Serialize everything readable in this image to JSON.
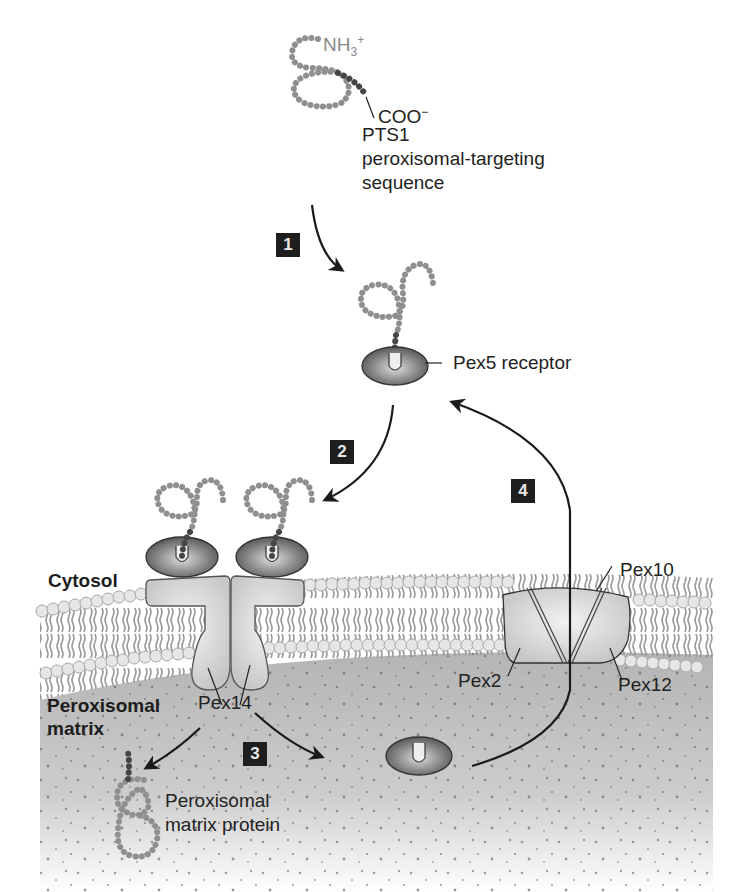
{
  "figure": {
    "colors": {
      "protein_chain": "#8f8f8f",
      "targeting_sequence": "#4a4a4a",
      "receptor_dark": "#555555",
      "receptor_light": "#d8d8d8",
      "membrane_head": "#e0e0e0",
      "matrix_fill": "#b9b9b9",
      "pex_protein_fill": "#dcdcdc",
      "badge_bg": "#1e1e1e",
      "arrow": "#1a1a1a"
    }
  },
  "labels": {
    "n_terminus": "NH",
    "n_terminus_sub": "3",
    "n_terminus_sup": "+",
    "c_terminus": "COO",
    "c_terminus_sup": "−",
    "pts1": "PTS1",
    "pts1_desc_line1": "peroxisomal-targeting",
    "pts1_desc_line2": "sequence",
    "pex5": "Pex5 receptor",
    "cytosol": "Cytosol",
    "matrix_line1": "Peroxisomal",
    "matrix_line2": "matrix",
    "pex14": "Pex14",
    "pex10": "Pex10",
    "pex2": "Pex2",
    "pex12": "Pex12",
    "matrix_protein_line1": "Peroxisomal",
    "matrix_protein_line2": "matrix protein"
  },
  "steps": [
    {
      "number": "1",
      "description": "PTS1 binds Pex5 receptor in cytosol"
    },
    {
      "number": "2",
      "description": "Receptor-cargo complex docks on Pex14"
    },
    {
      "number": "3",
      "description": "Cargo released into matrix"
    },
    {
      "number": "4",
      "description": "Pex5 recycled to cytosol via Pex2/Pex10/Pex12"
    }
  ]
}
